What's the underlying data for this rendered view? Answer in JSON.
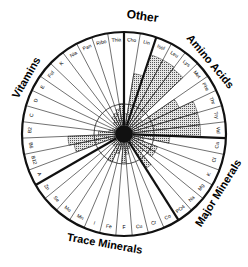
{
  "chart_data": {
    "type": "radial_bar",
    "title": "",
    "center": [
      124,
      134
    ],
    "outer_radius": 102,
    "reference_circle_radius": 30,
    "groups": [
      {
        "name": "Other",
        "items": [
          "Cho",
          "Lin"
        ]
      },
      {
        "name": "Amino Acids",
        "items": [
          "Isol",
          "Leu",
          "Lys",
          "Met",
          "Phe",
          "Thr",
          "Try",
          "Val"
        ]
      },
      {
        "name": "Major Minerals",
        "items": [
          "Ca",
          "Cl",
          "K",
          "Mg",
          "Na",
          "PO4"
        ]
      },
      {
        "name": "Trace Minerals",
        "items": [
          "Co",
          "Cr",
          "Cu",
          "F",
          "Fe",
          "I",
          "Mn",
          "Mo",
          "Se",
          "Zn"
        ]
      },
      {
        "name": "Vitamins",
        "items": [
          "A",
          "B12",
          "B6",
          "B2",
          "C",
          "D",
          "E",
          "Fol",
          "K",
          "Nia",
          "Pan",
          "Ribo",
          "Thia"
        ]
      }
    ],
    "categories": [
      "Cho",
      "Lin",
      "Isol",
      "Leu",
      "Lys",
      "Met",
      "Phe",
      "Thr",
      "Try",
      "Val",
      "Ca",
      "Cl",
      "K",
      "Mg",
      "Na",
      "PO4",
      "Co",
      "Cr",
      "Cu",
      "F",
      "Fe",
      "I",
      "Mn",
      "Mo",
      "Se",
      "Zn",
      "A",
      "B12",
      "B6",
      "B2",
      "C",
      "D",
      "E",
      "Fol",
      "K",
      "Nia",
      "Pan",
      "Ribo",
      "Thia"
    ],
    "values": [
      0.2,
      0.6,
      0.82,
      0.82,
      0.8,
      0.22,
      0.6,
      0.75,
      0.75,
      0.75,
      0.45,
      0.2,
      0.35,
      0.35,
      0.25,
      0.4,
      0.1,
      0.15,
      0.2,
      0.28,
      0.15,
      0.2,
      0.3,
      0.15,
      0.15,
      0.1,
      0.15,
      0.5,
      0.55,
      0.25,
      0.15,
      0.12,
      0.1,
      0.1,
      0.15,
      0.2,
      0.22,
      0.25,
      0.3
    ],
    "value_scale": "fraction of outer radius",
    "xlabel": "",
    "ylabel": "",
    "legend": []
  },
  "labels": {
    "other": "Other",
    "amino": "Amino Acids",
    "major": "Major Minerals",
    "trace": "Trace Minerals",
    "vitamins": "Vitamins"
  }
}
